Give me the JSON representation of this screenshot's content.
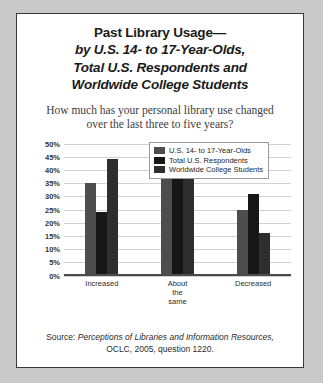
{
  "title": {
    "line1": "Past Library Usage—",
    "line2": "by U.S. 14- to 17-Year-Olds,",
    "line3": "Total U.S. Respondents and",
    "line4": "Worldwide College Students"
  },
  "question": "How much has your personal library use changed over the last three to five years?",
  "source": {
    "prefix": "Source:",
    "italic_part": "Perceptions of Libraries and Information Resources,",
    "rest": "OCLC, 2005, question 1220."
  },
  "colors": {
    "series_1": "#4d4d4d",
    "series_2": "#171717",
    "series_3": "#2e2e2e",
    "panel_background": "#ffffff",
    "outer_background": "#c9c9c9",
    "border": "#3a3a3a",
    "gridline": "#d2d2d2"
  },
  "chart_data": {
    "type": "bar",
    "subtitle": "How much has your personal library use changed over the last three to five years?",
    "xlabel": "",
    "ylabel": "",
    "ylim": [
      0,
      50
    ],
    "ytick_labels": [
      "50%",
      "45%",
      "40%",
      "35%",
      "30%",
      "25%",
      "20%",
      "15%",
      "10%",
      "5%",
      "0%"
    ],
    "ytick_values": [
      50,
      45,
      40,
      35,
      30,
      25,
      20,
      15,
      10,
      5,
      0
    ],
    "grid": true,
    "legend_position": "top-right",
    "categories": [
      "Increased",
      "About the\nsame",
      "Decreased"
    ],
    "series": [
      {
        "name": "U.S. 14- to 17-Year-Olds",
        "color": "#4d4d4d",
        "values": [
          35,
          39,
          25
        ]
      },
      {
        "name": "Total U.S. Respondents",
        "color": "#171717",
        "values": [
          24,
          45,
          31
        ]
      },
      {
        "name": "Worldwide College Students",
        "color": "#2e2e2e",
        "values": [
          44,
          40,
          16
        ]
      }
    ]
  }
}
